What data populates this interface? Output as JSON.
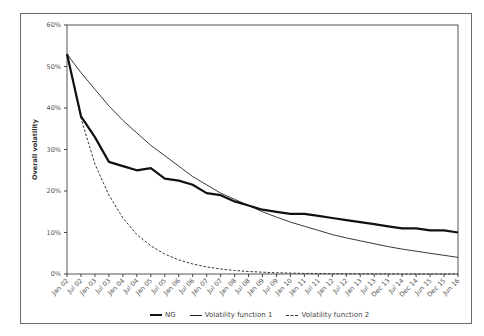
{
  "chart_data": {
    "type": "line",
    "title": "",
    "xlabel": "",
    "ylabel": "Overall volatility",
    "ylim": [
      0,
      60
    ],
    "yticks": [
      "0%",
      "10%",
      "20%",
      "30%",
      "40%",
      "50%",
      "60%"
    ],
    "grid": false,
    "legend_position": "bottom",
    "categories": [
      "Jan 02",
      "Jul 02",
      "Jan 03",
      "Jul 03",
      "Jan 04",
      "Jul 04",
      "Jan 05",
      "Jul 05",
      "Jan 06",
      "Jul 06",
      "Jan 07",
      "Jul 07",
      "Jan 08",
      "Jul 08",
      "Jan 09",
      "Jul 09",
      "Jan 10",
      "Jan 11",
      "Jul 11",
      "Jan 12",
      "Jul 12",
      "Jan 13",
      "Jul 13",
      "Dec 13",
      "Jul 14",
      "Dec 14",
      "Jun 15",
      "Dec 15",
      "Jun 16"
    ],
    "series": [
      {
        "name": "NG",
        "style": "thick-solid",
        "values": [
          53,
          38,
          33,
          27,
          26,
          25,
          25.5,
          23,
          22.5,
          21.5,
          19.5,
          19,
          17.5,
          16.5,
          15.5,
          15,
          14.5,
          14.5,
          14,
          13.5,
          13,
          12.5,
          12,
          11.5,
          11,
          11,
          10.5,
          10.5,
          10
        ]
      },
      {
        "name": "Volatility function 1",
        "style": "thin-solid",
        "values": [
          53,
          48.5,
          44.5,
          40.5,
          37,
          34,
          31,
          28.5,
          26,
          23.5,
          21.5,
          19.5,
          18,
          16.5,
          15,
          13.7,
          12.5,
          11.5,
          10.5,
          9.5,
          8.7,
          8,
          7.3,
          6.6,
          6,
          5.5,
          5,
          4.5,
          4
        ]
      },
      {
        "name": "Volatility function 2",
        "style": "dashed",
        "values": [
          53,
          37.5,
          26.5,
          19,
          13.5,
          9.5,
          6.8,
          4.8,
          3.4,
          2.4,
          1.7,
          1.2,
          0.85,
          0.6,
          0.43,
          0.3,
          0.22,
          0.15,
          0.11,
          0.08,
          0.05,
          0.04,
          0.03,
          0.02,
          0.01,
          0.01,
          0,
          0,
          0
        ]
      }
    ]
  },
  "legend": {
    "items": [
      {
        "label": "NG"
      },
      {
        "label": "Volatility function 1"
      },
      {
        "label": "Volatility function 2"
      }
    ]
  }
}
